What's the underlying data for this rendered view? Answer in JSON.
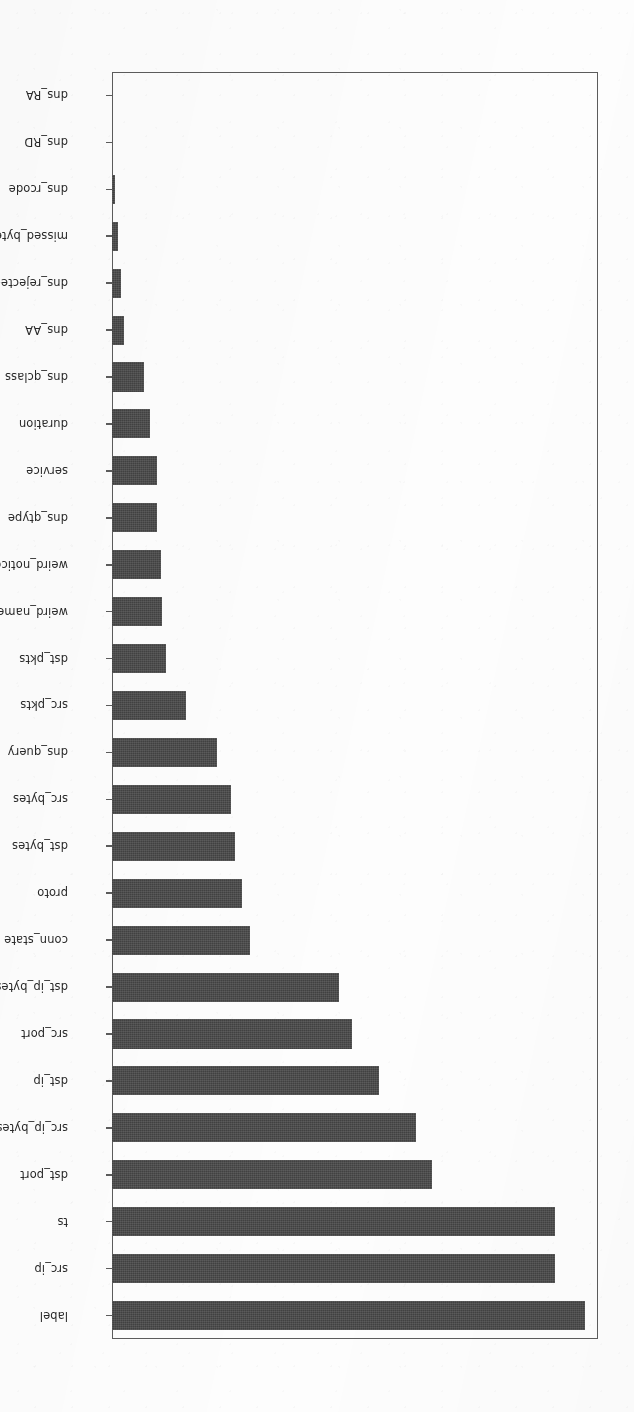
{
  "figure": {
    "orientation": "rotated-180",
    "background_color": "#fdfdfd",
    "bar_color": "#484848",
    "axis_color": "#5c5c5c"
  },
  "axis": {
    "x_tick_labels": [
      "0.0",
      "0.1",
      "0.2",
      "0.3",
      "0.4",
      "0.5",
      "0.6",
      "0.7"
    ],
    "x_tick_values": [
      0.0,
      0.1,
      0.2,
      0.3,
      0.4,
      0.5,
      0.6,
      0.7
    ],
    "x_reversed": true,
    "xlabel": "",
    "ylabel": "",
    "title": ""
  },
  "chart_data": {
    "type": "bar",
    "orientation": "horizontal",
    "title": "",
    "xlabel": "",
    "ylabel": "",
    "xlim": [
      0.0,
      0.74
    ],
    "ylim": null,
    "grid": false,
    "legend": null,
    "x_reversed": true,
    "categories": [
      "label",
      "src_ip",
      "ts",
      "dst_port",
      "src_ip_bytes",
      "dst_ip",
      "src_port",
      "dst_ip_bytes",
      "conn_state",
      "proto",
      "dst_bytes",
      "src_bytes",
      "dns_query",
      "src_pkts",
      "dst_pkts",
      "weird_name",
      "weird_notice",
      "dns_qtype",
      "service",
      "duration",
      "dns_qclass",
      "dns_AA",
      "dns_rejected",
      "missed_bytes",
      "dns_rcode",
      "dns_RD",
      "dns_RA"
    ],
    "values": [
      0.72,
      0.674,
      0.674,
      0.488,
      0.463,
      0.406,
      0.365,
      0.346,
      0.21,
      0.198,
      0.187,
      0.181,
      0.16,
      0.113,
      0.082,
      0.076,
      0.074,
      0.068,
      0.068,
      0.058,
      0.048,
      0.019,
      0.014,
      0.009,
      0.005,
      0.0,
      0.0
    ]
  }
}
